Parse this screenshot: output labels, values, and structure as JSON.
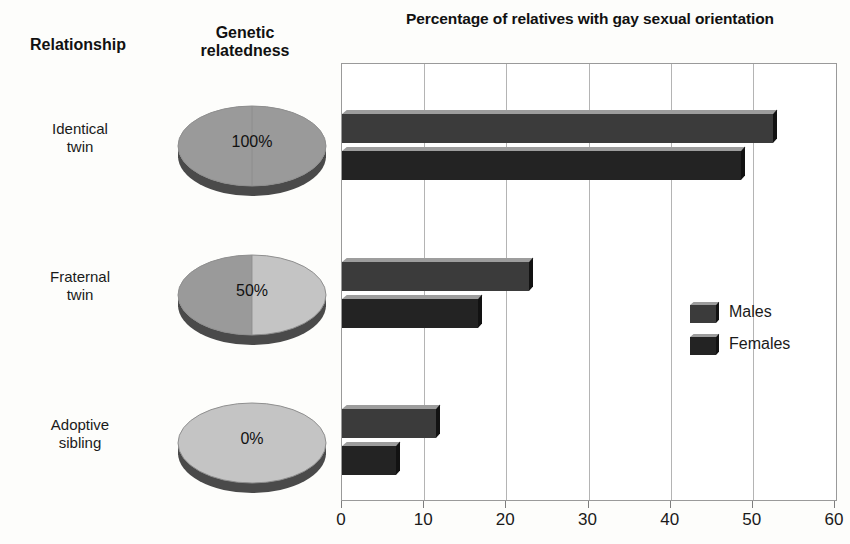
{
  "chart_data": {
    "type": "bar",
    "orientation": "horizontal",
    "title": "Percentage of relatives with gay sexual orientation",
    "xlabel": "",
    "ylabel": "",
    "xlim": [
      0,
      60
    ],
    "xticks": [
      0,
      10,
      20,
      30,
      40,
      50,
      60
    ],
    "xticklabels": [
      "0",
      "10",
      "20",
      "30",
      "40",
      "50",
      "60"
    ],
    "grid": "vertical",
    "legend_position": "right-middle",
    "categories": [
      "Identical twin",
      "Fraternal twin",
      "Adoptive sibling"
    ],
    "series": [
      {
        "name": "Males",
        "values": [
          52.5,
          22.7,
          11.5
        ],
        "color": "#3b3b3b"
      },
      {
        "name": "Females",
        "values": [
          48.5,
          16.6,
          6.6
        ],
        "color": "#232323"
      }
    ],
    "annotations": {
      "genetic_relatedness": [
        "100%",
        "50%",
        "0%"
      ]
    }
  },
  "table": {
    "headers": {
      "relationship": "Relationship",
      "genetic_relatedness_line1": "Genetic",
      "genetic_relatedness_line2": "relatedness"
    },
    "rows": [
      {
        "relationship_line1": "Identical",
        "relationship_line2": "twin",
        "genetic_pct": "100%",
        "pie_fraction": 1.0
      },
      {
        "relationship_line1": "Fraternal",
        "relationship_line2": "twin",
        "genetic_pct": "50%",
        "pie_fraction": 0.5
      },
      {
        "relationship_line1": "Adoptive",
        "relationship_line2": "sibling",
        "genetic_pct": "0%",
        "pie_fraction": 0.0
      }
    ]
  },
  "legend": {
    "items": [
      {
        "label": "Males"
      },
      {
        "label": "Females"
      }
    ]
  },
  "colors": {
    "bar_males": "#3b3b3b",
    "bar_females": "#232323",
    "bar_top": "#9d9d9d",
    "bar_side": "#121212",
    "pie_related": "#9a9a9a",
    "pie_unrelated": "#c4c4c4",
    "pie_edge": "#4a4a4a",
    "plot_border": "#9a9a9a",
    "gridline": "#b4b4b4",
    "background": "#fdfdfb",
    "text": "#1a1a1a"
  }
}
